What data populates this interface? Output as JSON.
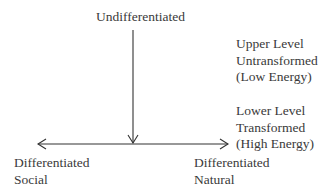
{
  "top_label": "Undifferentiated",
  "upper_level": [
    "Upper Level",
    "Untransformed",
    "(Low Energy)"
  ],
  "lower_level": [
    "Lower Level",
    "Transformed",
    "(High Energy)"
  ],
  "left_label": [
    "Differentiated",
    "Social"
  ],
  "right_label": [
    "Differentiated",
    "Natural"
  ],
  "colors": {
    "line": "#333333",
    "text": "#3a3a3a"
  }
}
